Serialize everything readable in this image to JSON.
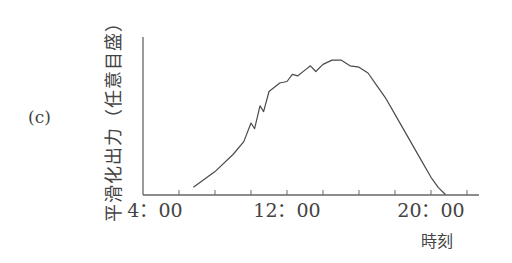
{
  "panel": {
    "label": "(c)"
  },
  "chart_data": {
    "type": "line",
    "title": "",
    "panel_label": "(c)",
    "xlabel": "時刻",
    "ylabel": "平滑化出力（任意目盛）",
    "x_tick_labels": [
      "4：00",
      "12：00",
      "20：00"
    ],
    "x_tick_hours": [
      4,
      6,
      8,
      10,
      12,
      14,
      16,
      18,
      20,
      22
    ],
    "x_labeled_hours": [
      4,
      12,
      20
    ],
    "xlim_hours": [
      4,
      23
    ],
    "ylim": [
      0,
      1
    ],
    "y_ticks": "none (arbitrary scale)",
    "grid": false,
    "legend": "none",
    "series": [
      {
        "name": "平滑化出力",
        "x_hours": [
          6.8,
          8.0,
          9.0,
          9.6,
          10.0,
          10.2,
          10.5,
          10.7,
          11.0,
          11.3,
          11.6,
          12.0,
          12.3,
          12.6,
          13.0,
          13.3,
          13.6,
          14.0,
          14.5,
          15.0,
          15.5,
          16.0,
          16.5,
          17.0,
          17.5,
          18.0,
          18.5,
          19.0,
          19.5,
          20.0,
          20.4,
          20.8
        ],
        "y_norm": [
          0.05,
          0.16,
          0.28,
          0.37,
          0.5,
          0.46,
          0.62,
          0.58,
          0.72,
          0.75,
          0.78,
          0.79,
          0.84,
          0.83,
          0.87,
          0.9,
          0.86,
          0.91,
          0.94,
          0.94,
          0.9,
          0.89,
          0.85,
          0.76,
          0.67,
          0.56,
          0.45,
          0.34,
          0.23,
          0.12,
          0.05,
          0.0
        ]
      }
    ]
  }
}
